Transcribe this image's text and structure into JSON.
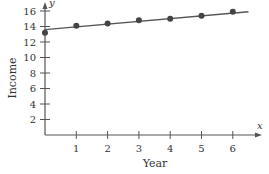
{
  "chart_data": {
    "type": "scatter",
    "title": "",
    "xlabel": "Year",
    "ylabel": "Income",
    "x_axis_var": "x",
    "y_axis_var": "y",
    "xlim": [
      0,
      6.9
    ],
    "ylim": [
      0,
      17
    ],
    "x_ticks": [
      1,
      2,
      3,
      4,
      5,
      6
    ],
    "y_ticks": [
      2,
      4,
      6,
      8,
      10,
      12,
      14,
      16
    ],
    "grid": false,
    "legend": null,
    "series": [
      {
        "name": "Income data",
        "kind": "scatter",
        "x": [
          0,
          1,
          2,
          3,
          4,
          5,
          6
        ],
        "y": [
          13.2,
          14.1,
          14.4,
          14.8,
          15.0,
          15.4,
          15.9
        ]
      },
      {
        "name": "Trend line",
        "kind": "line",
        "x": [
          0,
          6.5
        ],
        "y": [
          13.6,
          15.9
        ]
      }
    ],
    "colors": {
      "axis": "#555555",
      "points": "#444444",
      "line": "#555555",
      "text": "#333333"
    }
  }
}
